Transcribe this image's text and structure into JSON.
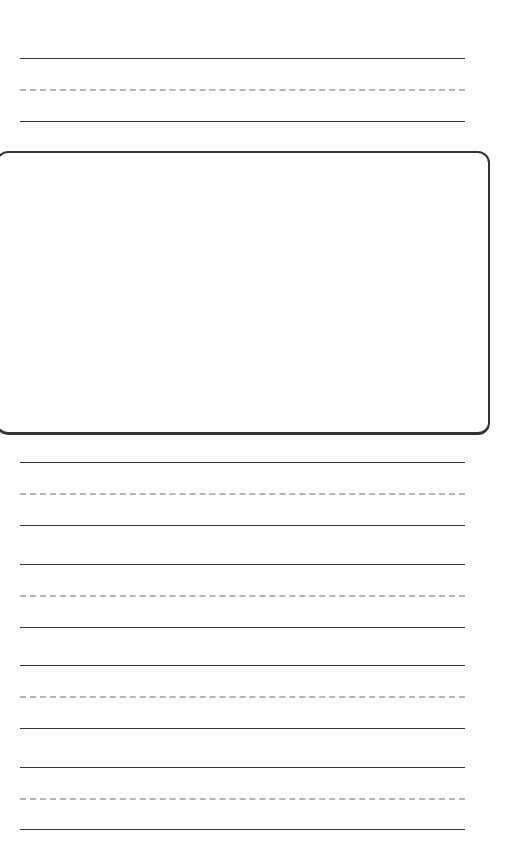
{
  "sheet": {
    "type": "handwriting-practice",
    "line_groups": [
      {
        "top": 58,
        "mid": 89,
        "base": 121
      },
      {
        "top": 462,
        "mid": 493,
        "base": 525
      },
      {
        "top": 564,
        "mid": 595,
        "base": 627
      },
      {
        "top": 665,
        "mid": 696,
        "base": 728
      },
      {
        "top": 767,
        "mid": 798,
        "base": 829
      }
    ],
    "drawing_box": {
      "label": ""
    }
  }
}
